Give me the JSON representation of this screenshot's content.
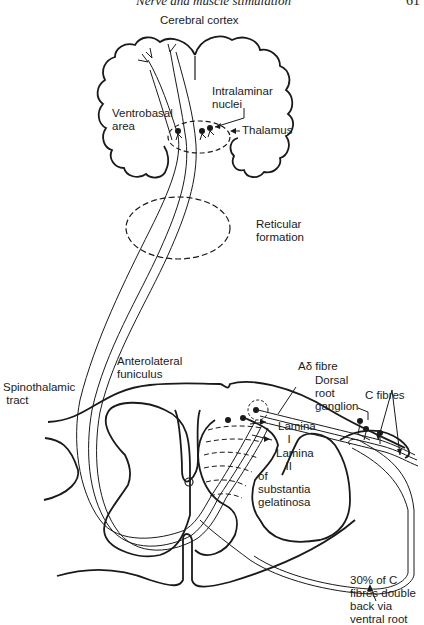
{
  "page_header": {
    "running_title": "Nerve and muscle stimulation",
    "page_number": "61"
  },
  "diagram": {
    "labels": {
      "cerebral_cortex": "Cerebral cortex",
      "intralaminar_nuclei": "Intralaminar\nnuclei",
      "ventrobasal_area": "Ventrobasal\narea",
      "thalamus": "Thalamus",
      "reticular_formation": "Reticular\nformation",
      "anterolateral_funiculus": "Anterolateral\nfuniculus",
      "spinothalamic_tract": "Spinothalamic\n tract",
      "a_delta_fibre": "Aδ fibre",
      "dorsal_root_ganglion": "Dorsal\nroot\nganglion",
      "c_fibres": "C fibres",
      "lamina_i": "Lamina\n   I",
      "lamina_ii": "Lamina\n   II",
      "substantia_gelatinosa": "of\nsubstantia\ngelatinosa",
      "c_fibres_ventral_root": "30% of C\nfibres double\nback via\nventral root"
    },
    "colors": {
      "line": "#1a1a1a",
      "background": "#ffffff"
    }
  }
}
